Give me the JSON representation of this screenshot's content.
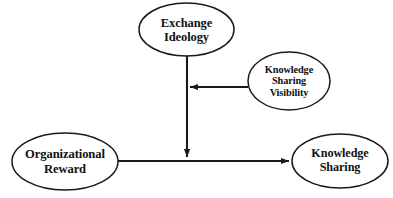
{
  "diagram": {
    "type": "conceptual-research-model",
    "background_color": "#ffffff",
    "stroke_color": "#1a1a1a",
    "text_color": "#111111",
    "nodes": [
      {
        "id": "exchange_ideology",
        "label": "Exchange\nIdeology",
        "shape": "ellipse",
        "cx": 186.5,
        "cy": 29.5,
        "rx": 47.5,
        "ry": 26.5
      },
      {
        "id": "knowledge_sharing_visibility",
        "label": "Knowledge\nSharing\nVisibility",
        "shape": "ellipse",
        "cx": 289,
        "cy": 81,
        "rx": 41,
        "ry": 29
      },
      {
        "id": "organizational_reward",
        "label": "Organizational\nReward",
        "shape": "ellipse",
        "cx": 65,
        "cy": 161.5,
        "rx": 53,
        "ry": 28.5
      },
      {
        "id": "knowledge_sharing",
        "label": "Knowledge\nSharing",
        "shape": "ellipse",
        "cx": 340,
        "cy": 161,
        "rx": 48,
        "ry": 27
      }
    ],
    "edges": [
      {
        "id": "edge_reward_to_sharing",
        "from": "organizational_reward",
        "to": "knowledge_sharing",
        "arrow": "end",
        "path": "M 118 161 L 289 161"
      },
      {
        "id": "edge_ideology_to_path",
        "from": "exchange_ideology",
        "to": "edge_reward_to_sharing",
        "arrow": "end",
        "path": "M 187 56 L 187 157"
      },
      {
        "id": "edge_visibility_to_path",
        "from": "knowledge_sharing_visibility",
        "to": "edge_ideology_to_path",
        "arrow": "end",
        "path": "M 248 87 L 190 87"
      }
    ]
  }
}
